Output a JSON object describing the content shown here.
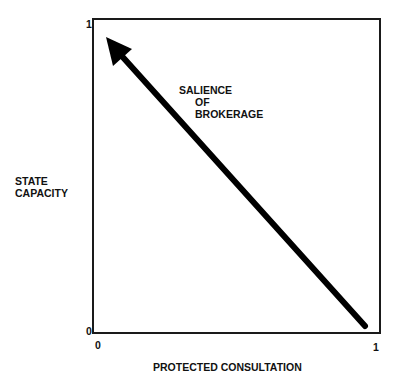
{
  "diagram": {
    "y_axis": {
      "label_line1": "STATE",
      "label_line2": "CAPACITY",
      "tick_top": "1",
      "tick_bottom": "0"
    },
    "x_axis": {
      "label": "PROTECTED CONSULTATION",
      "tick_left": "0",
      "tick_right": "1"
    },
    "arrow": {
      "label_line1": "SALIENCE",
      "label_line2": "OF",
      "label_line3": "BROKERAGE",
      "from": [
        1,
        0
      ],
      "to": [
        0,
        1
      ],
      "color": "#000000"
    }
  }
}
